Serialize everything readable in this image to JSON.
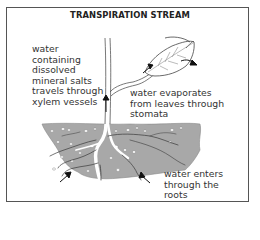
{
  "diagram": {
    "title": "TRANSPIRATION STREAM",
    "labels": {
      "xylem": "water\ncontaining\ndissolved\nmineral salts\ntravels through\nxylem vessels",
      "leaves": "water evaporates\nfrom leaves through\nstomata",
      "roots": "water enters\nthrough the\nroots"
    },
    "parts": [
      "stem",
      "leaf",
      "soil",
      "roots",
      "arrows"
    ],
    "colors": {
      "soil": "#a9a9a9",
      "outline": "#333333",
      "border": "#555555"
    }
  }
}
